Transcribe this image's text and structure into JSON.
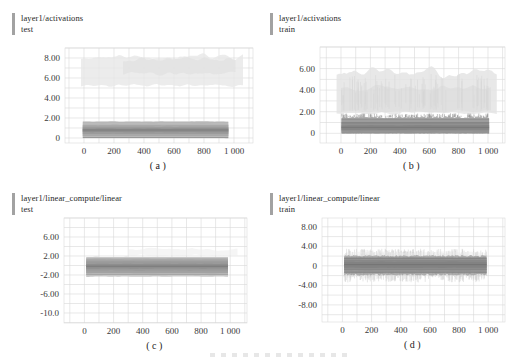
{
  "page": {
    "background": "#ffffff"
  },
  "colors": {
    "grid": "#d9d9d9",
    "tick_text": "#3a3a3a",
    "title_text": "#1f1f1f",
    "title_bar": "#a2a2a2",
    "caption_text": "#222222"
  },
  "chart_data": {
    "type": "area",
    "subtype": "tensorboard-distribution-histograms",
    "grid": "on",
    "charts": [
      {
        "id": "a",
        "tag": "layer1/activations",
        "run": "test",
        "caption": "(a)",
        "axis": {
          "xmin": -127,
          "xmax": 1127,
          "ymin": -0.5,
          "ymax": 9.0,
          "xgrid": 100,
          "ygrid": 1
        },
        "plot": {
          "x": 65,
          "y": 48,
          "w": 188,
          "h": 95
        },
        "yticks": [
          {
            "v": 8,
            "label": "8.00"
          },
          {
            "v": 6,
            "label": "6.00"
          },
          {
            "v": 4,
            "label": "4.00"
          },
          {
            "v": 2,
            "label": "2.00"
          },
          {
            "v": 0,
            "label": "0"
          }
        ],
        "xticks": [
          {
            "v": 0,
            "label": "0"
          },
          {
            "v": 200,
            "label": "200"
          },
          {
            "v": 400,
            "label": "400"
          },
          {
            "v": 600,
            "label": "600"
          },
          {
            "v": 800,
            "label": "800"
          },
          {
            "v": 1000,
            "label": "1 000"
          }
        ],
        "layers": [
          {
            "t": "band",
            "x0": -20,
            "x1": 1060,
            "y0": 5.3,
            "y1": 8.1,
            "f": "#e7e7e7",
            "o": 0.8,
            "jt": 1.2,
            "jb": 0.7,
            "sm": 1,
            "seed": 11,
            "n": 64
          },
          {
            "t": "band",
            "x0": 260,
            "x1": 1010,
            "y0": 6.5,
            "y1": 7.9,
            "f": "#dfdfdf",
            "o": 0.6,
            "jt": 1.0,
            "jb": 0.8,
            "sm": 1,
            "seed": 21,
            "n": 48
          },
          {
            "t": "band",
            "x0": -8,
            "x1": 962,
            "y0": 0,
            "y1": 1.68,
            "f": "#c7c7c7",
            "o": 0.95,
            "jt": 0.1,
            "jb": 0.05,
            "sm": 1,
            "seed": 3,
            "n": 64
          },
          {
            "t": "line",
            "y": 1.52,
            "x0": -8,
            "x1": 962,
            "f": "#a3a3a3",
            "w": 0.8,
            "o": 0.9
          },
          {
            "t": "band",
            "x0": -8,
            "x1": 962,
            "y0": 0.06,
            "y1": 1.46,
            "f": "#b5b5b5",
            "o": 0.95,
            "jt": 0.08,
            "jb": 0.04,
            "sm": 1,
            "seed": 4
          },
          {
            "t": "band",
            "x0": -8,
            "x1": 962,
            "y0": 0.2,
            "y1": 1.3,
            "f": "#a7a7a7",
            "o": 0.95,
            "jt": 0.06,
            "jb": 0.04,
            "sm": 1,
            "seed": 5
          },
          {
            "t": "band",
            "x0": -8,
            "x1": 962,
            "y0": 0.4,
            "y1": 1.12,
            "f": "#9a9a9a",
            "o": 0.95,
            "jt": 0.05,
            "jb": 0.05,
            "sm": 1,
            "seed": 6
          },
          {
            "t": "band",
            "x0": -8,
            "x1": 962,
            "y0": 0.58,
            "y1": 0.97,
            "f": "#8e8e8e",
            "o": 0.95,
            "jt": 0.05,
            "jb": 0.05,
            "sm": 1,
            "seed": 7
          },
          {
            "t": "line",
            "y": 0.8,
            "x0": -8,
            "x1": 962,
            "f": "#7b7b7b",
            "w": 1,
            "o": 0.95
          },
          {
            "t": "line",
            "y": 0.04,
            "x0": -8,
            "x1": 962,
            "f": "#888888",
            "w": 0.9,
            "o": 0.9
          }
        ]
      },
      {
        "id": "b",
        "tag": "layer1/activations",
        "run": "train",
        "caption": "(b)",
        "axis": {
          "xmin": -143,
          "xmax": 1116,
          "ymin": -0.9,
          "ymax": 8.0,
          "xgrid": 100,
          "ygrid": 1
        },
        "plot": {
          "x": 62,
          "y": 47,
          "w": 185,
          "h": 96
        },
        "yticks": [
          {
            "v": 6,
            "label": "6.00"
          },
          {
            "v": 4,
            "label": "4.00"
          },
          {
            "v": 2,
            "label": "2.00"
          },
          {
            "v": 0,
            "label": "0"
          }
        ],
        "xticks": [
          {
            "v": 0,
            "label": "0"
          },
          {
            "v": 200,
            "label": "200"
          },
          {
            "v": 400,
            "label": "400"
          },
          {
            "v": 600,
            "label": "600"
          },
          {
            "v": 800,
            "label": "800"
          },
          {
            "v": 1000,
            "label": "1 000"
          }
        ],
        "layers": [
          {
            "t": "band",
            "x0": -30,
            "x1": 1060,
            "y0": 1.9,
            "y1": 5.6,
            "f": "#e4e4e4",
            "o": 0.85,
            "jt": 1.4,
            "jb": 0.5,
            "sm": 1,
            "seed": 13,
            "n": 64
          },
          {
            "t": "band",
            "x0": 0,
            "x1": 1020,
            "y0": 2.0,
            "y1": 4.3,
            "f": "#dbdbdb",
            "o": 0.6,
            "jt": 1.2,
            "jb": 0.4,
            "sm": 1,
            "seed": 23,
            "n": 48
          },
          {
            "t": "spikes",
            "x0": 0,
            "x1": 1010,
            "ya": [
              2.0,
              2.8
            ],
            "yb": [
              3.4,
              5.5
            ],
            "count": 90,
            "f": "#d6d6d6",
            "o": 0.6,
            "w": 0.9,
            "seed": 31
          },
          {
            "t": "band",
            "x0": 3,
            "x1": 1008,
            "y0": 0,
            "y1": 1.5,
            "f": "#adadad",
            "o": 0.95,
            "jt": 0.22,
            "jb": 0.05,
            "sm": 0,
            "seed": 14,
            "n": 110
          },
          {
            "t": "spikes",
            "x0": 3,
            "x1": 1008,
            "ya": [
              1.45,
              1.55
            ],
            "yb": [
              1.6,
              1.85
            ],
            "count": 130,
            "f": "#9a9a9a",
            "o": 0.85,
            "w": 0.7,
            "seed": 15
          },
          {
            "t": "band",
            "x0": 3,
            "x1": 1008,
            "y0": 0.05,
            "y1": 1.28,
            "f": "#9c9c9c",
            "o": 0.95,
            "jt": 0.08,
            "jb": 0.05,
            "sm": 1,
            "seed": 16
          },
          {
            "t": "band",
            "x0": 3,
            "x1": 1008,
            "y0": 0.16,
            "y1": 1.0,
            "f": "#8f8f8f",
            "o": 0.95,
            "jt": 0.06,
            "jb": 0.05,
            "sm": 1,
            "seed": 17
          },
          {
            "t": "band",
            "x0": 3,
            "x1": 1008,
            "y0": 0.32,
            "y1": 0.75,
            "f": "#858585",
            "o": 0.95,
            "jt": 0.06,
            "jb": 0.06,
            "sm": 1,
            "seed": 18
          },
          {
            "t": "line",
            "y": 1.32,
            "x0": 3,
            "x1": 1008,
            "f": "#7f7f7f",
            "w": 0.9,
            "o": 0.9
          },
          {
            "t": "line",
            "y": 0.97,
            "x0": 3,
            "x1": 1008,
            "f": "#7b7b7b",
            "w": 0.9,
            "o": 0.9
          },
          {
            "t": "line",
            "y": 0.55,
            "x0": 3,
            "x1": 1008,
            "f": "#787878",
            "w": 1,
            "o": 0.95
          },
          {
            "t": "line",
            "y": 0.03,
            "x0": 3,
            "x1": 1008,
            "f": "#7f7f7f",
            "w": 0.9,
            "o": 0.9
          }
        ]
      },
      {
        "id": "c",
        "tag": "layer1/linear_compute/linear",
        "run": "test",
        "caption": "(c)",
        "axis": {
          "xmin": -140,
          "xmax": 1115,
          "ymin": -12.1,
          "ymax": 10.0,
          "xgrid": 100,
          "ygrid": 2
        },
        "plot": {
          "x": 64,
          "y": 38,
          "w": 183,
          "h": 105
        },
        "yticks": [
          {
            "v": 6,
            "label": "6.00"
          },
          {
            "v": 2,
            "label": "2.00"
          },
          {
            "v": -2,
            "label": "-2.00"
          },
          {
            "v": -6,
            "label": "-6.00"
          },
          {
            "v": -10,
            "label": "-10.0"
          }
        ],
        "xticks": [
          {
            "v": 0,
            "label": "0"
          },
          {
            "v": 200,
            "label": "200"
          },
          {
            "v": 400,
            "label": "400"
          },
          {
            "v": 600,
            "label": "600"
          },
          {
            "v": 800,
            "label": "800"
          },
          {
            "v": 1000,
            "label": "1 000"
          }
        ],
        "layers": [
          {
            "t": "band",
            "x0": 300,
            "x1": 1050,
            "y0": 2.1,
            "y1": 3.4,
            "f": "#ececec",
            "o": 0.55,
            "jt": 1.0,
            "jb": 0.8,
            "sm": 1,
            "seed": 41,
            "n": 48
          },
          {
            "t": "band",
            "x0": 12,
            "x1": 985,
            "y0": -2.35,
            "y1": 1.8,
            "f": "#c5c5c5",
            "o": 0.95,
            "jt": 0.12,
            "jb": 0.12,
            "sm": 1,
            "seed": 42,
            "n": 64
          },
          {
            "t": "band",
            "x0": 12,
            "x1": 985,
            "y0": -2.02,
            "y1": 1.52,
            "f": "#b4b4b4",
            "o": 0.95,
            "jt": 0.1,
            "jb": 0.1,
            "sm": 1,
            "seed": 43
          },
          {
            "t": "band",
            "x0": 12,
            "x1": 985,
            "y0": -1.6,
            "y1": 1.2,
            "f": "#a6a6a6",
            "o": 0.95,
            "jt": 0.1,
            "jb": 0.1,
            "sm": 1,
            "seed": 44
          },
          {
            "t": "band",
            "x0": 12,
            "x1": 985,
            "y0": -1.1,
            "y1": 0.8,
            "f": "#999999",
            "o": 0.95,
            "jt": 0.1,
            "jb": 0.1,
            "sm": 1,
            "seed": 45
          },
          {
            "t": "band",
            "x0": 12,
            "x1": 985,
            "y0": -0.65,
            "y1": 0.35,
            "f": "#8d8d8d",
            "o": 0.95,
            "jt": 0.1,
            "jb": 0.1,
            "sm": 1,
            "seed": 46
          },
          {
            "t": "line",
            "y": 1.35,
            "x0": 12,
            "x1": 985,
            "f": "#9e9e9e",
            "w": 0.8,
            "o": 0.8
          },
          {
            "t": "line",
            "y": 0.9,
            "x0": 12,
            "x1": 985,
            "f": "#979797",
            "w": 0.8,
            "o": 0.8
          },
          {
            "t": "line",
            "y": -0.15,
            "x0": 12,
            "x1": 985,
            "f": "#777777",
            "w": 1,
            "o": 0.95
          },
          {
            "t": "line",
            "y": -1.35,
            "x0": 12,
            "x1": 985,
            "f": "#979797",
            "w": 0.8,
            "o": 0.8
          },
          {
            "t": "line",
            "y": -1.9,
            "x0": 12,
            "x1": 985,
            "f": "#9e9e9e",
            "w": 0.8,
            "o": 0.8
          }
        ]
      },
      {
        "id": "d",
        "tag": "layer1/linear_compute/linear",
        "run": "train",
        "caption": "(d)",
        "axis": {
          "xmin": -140,
          "xmax": 1115,
          "ymin": -11.5,
          "ymax": 9.8,
          "xgrid": 100,
          "ygrid": 2
        },
        "plot": {
          "x": 64,
          "y": 38,
          "w": 183,
          "h": 104
        },
        "yticks": [
          {
            "v": 8,
            "label": "8.00"
          },
          {
            "v": 4,
            "label": "4.00"
          },
          {
            "v": 0,
            "label": "0"
          },
          {
            "v": -4,
            "label": "-4.00"
          },
          {
            "v": -8,
            "label": "-8.00"
          }
        ],
        "xticks": [
          {
            "v": 0,
            "label": "0"
          },
          {
            "v": 200,
            "label": "200"
          },
          {
            "v": 400,
            "label": "400"
          },
          {
            "v": 600,
            "label": "600"
          },
          {
            "v": 800,
            "label": "800"
          },
          {
            "v": 1000,
            "label": "1 000"
          }
        ],
        "layers": [
          {
            "t": "spikes",
            "x0": 12,
            "x1": 988,
            "ya": [
              1.2,
              1.9
            ],
            "yb": [
              2.2,
              3.5
            ],
            "count": 210,
            "f": "#d3d3d3",
            "o": 0.7,
            "w": 0.8,
            "seed": 51
          },
          {
            "t": "spikes",
            "x0": 12,
            "x1": 988,
            "ya": [
              -1.0,
              -1.6
            ],
            "yb": [
              -1.9,
              -3.4
            ],
            "count": 210,
            "f": "#d3d3d3",
            "o": 0.7,
            "w": 0.8,
            "seed": 52
          },
          {
            "t": "band",
            "x0": 30,
            "x1": 960,
            "y0": 2.0,
            "y1": 2.9,
            "f": "#e8e8e8",
            "o": 0.45,
            "jt": 0.8,
            "jb": 0.5,
            "sm": 1,
            "seed": 53,
            "n": 48
          },
          {
            "t": "band",
            "x0": 12,
            "x1": 988,
            "y0": -1.85,
            "y1": 2.05,
            "f": "#aaaaaa",
            "o": 0.95,
            "jt": 0.35,
            "jb": 0.35,
            "sm": 0,
            "seed": 54,
            "n": 120
          },
          {
            "t": "spikes",
            "x0": 12,
            "x1": 988,
            "ya": [
              -1.8,
              -1.3
            ],
            "yb": [
              1.5,
              2.0
            ],
            "count": 240,
            "f": "#8f8f8f",
            "o": 0.3,
            "w": 0.7,
            "seed": 55
          },
          {
            "t": "band",
            "x0": 12,
            "x1": 988,
            "y0": -1.4,
            "y1": 1.72,
            "f": "#979797",
            "o": 0.95,
            "jt": 0.15,
            "jb": 0.15,
            "sm": 1,
            "seed": 56
          },
          {
            "t": "band",
            "x0": 12,
            "x1": 988,
            "y0": -0.9,
            "y1": 1.28,
            "f": "#8b8b8b",
            "o": 0.95,
            "jt": 0.12,
            "jb": 0.12,
            "sm": 1,
            "seed": 57
          },
          {
            "t": "band",
            "x0": 12,
            "x1": 988,
            "y0": -0.4,
            "y1": 0.85,
            "f": "#828282",
            "o": 0.95,
            "jt": 0.1,
            "jb": 0.1,
            "sm": 1,
            "seed": 58
          },
          {
            "t": "line",
            "y": 1.55,
            "x0": 12,
            "x1": 988,
            "f": "#7d7d7d",
            "w": 0.9,
            "o": 0.9
          },
          {
            "t": "line",
            "y": 1.05,
            "x0": 12,
            "x1": 988,
            "f": "#848484",
            "w": 0.8,
            "o": 0.8
          },
          {
            "t": "line",
            "y": 0.25,
            "x0": 12,
            "x1": 988,
            "f": "#747474",
            "w": 1,
            "o": 0.95
          },
          {
            "t": "line",
            "y": -0.75,
            "x0": 12,
            "x1": 988,
            "f": "#848484",
            "w": 0.8,
            "o": 0.8
          },
          {
            "t": "line",
            "y": -1.3,
            "x0": 12,
            "x1": 988,
            "f": "#7f7f7f",
            "w": 0.9,
            "o": 0.9
          }
        ]
      }
    ]
  }
}
